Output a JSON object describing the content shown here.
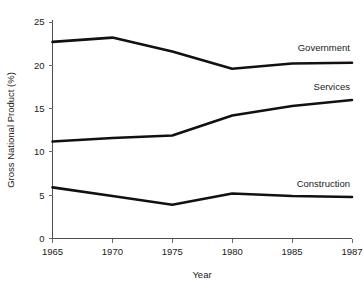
{
  "chart_data": {
    "type": "line",
    "title": "",
    "xlabel": "Year",
    "ylabel": "Gross National Product (%)",
    "categories": [
      "1965",
      "1970",
      "1975",
      "1980",
      "1985",
      "1987"
    ],
    "x": [
      1965,
      1970,
      1975,
      1980,
      1985,
      1987
    ],
    "xtick_labels": [
      "1965",
      "1970",
      "1975",
      "1980",
      "1985",
      "1987"
    ],
    "ytick_labels": [
      "0",
      "5",
      "10",
      "15",
      "20",
      "25"
    ],
    "yticks": [
      0,
      5,
      10,
      15,
      20,
      25
    ],
    "ylim": [
      0,
      25
    ],
    "grid": false,
    "legend_position": "inline-right-of-lines",
    "series": [
      {
        "name": "Government",
        "label": "Government",
        "color": "#111111",
        "values": [
          22.7,
          23.2,
          21.6,
          19.6,
          20.2,
          20.3
        ]
      },
      {
        "name": "Services",
        "label": "Services",
        "color": "#111111",
        "values": [
          11.2,
          11.6,
          11.9,
          14.2,
          15.3,
          16.0
        ]
      },
      {
        "name": "Construction",
        "label": "Construction",
        "color": "#111111",
        "values": [
          5.9,
          4.9,
          3.9,
          5.2,
          4.9,
          4.8
        ]
      }
    ]
  }
}
